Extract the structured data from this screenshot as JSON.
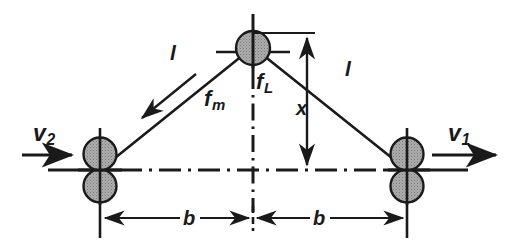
{
  "figure": {
    "background_color": "#ffffff",
    "line_color": "#1a1a1a",
    "mass_fill_color": "#a9a9a9",
    "mass_stroke_color": "#1a1a1a"
  },
  "labels": {
    "strut_left": {
      "text": "l",
      "sub": ""
    },
    "strut_right": {
      "text": "l",
      "sub": ""
    },
    "force_magnetic": {
      "text": "f",
      "sub": "m"
    },
    "force_load": {
      "text": "f",
      "sub": "L"
    },
    "velocity_left": {
      "text": "v",
      "sub": "2"
    },
    "velocity_right": {
      "text": "v",
      "sub": "1"
    },
    "height_dimension": {
      "text": "x",
      "sub": ""
    },
    "base_left": {
      "text": "b",
      "sub": ""
    },
    "base_right": {
      "text": "b",
      "sub": ""
    }
  },
  "icons": {
    "apex_mass": "circle-mass-icon",
    "left_mass_upper": "circle-mass-icon",
    "left_mass_lower": "circle-mass-icon",
    "right_mass_upper": "circle-mass-icon",
    "right_mass_lower": "circle-mass-icon",
    "velocity_left_arrow": "arrow-right-icon",
    "velocity_right_arrow": "arrow-right-icon",
    "force_magnetic_arrow": "arrow-down-left-icon",
    "height_dimension_arrow": "double-arrow-vertical-icon",
    "base_left_dimension_arrow": "double-arrow-horizontal-icon",
    "base_right_dimension_arrow": "double-arrow-horizontal-icon",
    "center_line_vertical": "centerline-icon",
    "center_line_horizontal": "centerline-icon"
  },
  "geometry": {
    "apex": {
      "x": 253,
      "y": 47
    },
    "left_joint": {
      "x": 100,
      "y": 170
    },
    "right_joint": {
      "x": 407,
      "y": 170
    },
    "mass_radius": 16,
    "base_half_span_label": "b",
    "height_label": "x",
    "strut_label": "l"
  }
}
